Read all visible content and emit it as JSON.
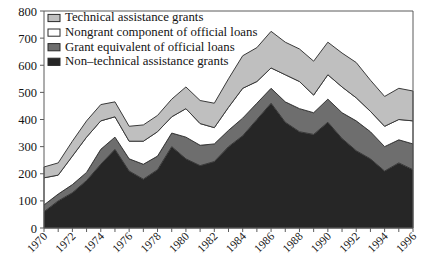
{
  "chart_data": {
    "type": "area",
    "stacked": true,
    "title": "",
    "subtitle": "",
    "xlabel": "",
    "ylabel": "",
    "xlim": [
      1970,
      1996
    ],
    "ylim": [
      0,
      800
    ],
    "yticks": [
      0,
      100,
      200,
      300,
      400,
      500,
      600,
      700,
      800
    ],
    "ytick_labels": [
      "0",
      "100",
      "200",
      "300",
      "400",
      "500",
      "600",
      "700",
      "800"
    ],
    "xticks": [
      1970,
      1971,
      1972,
      1973,
      1974,
      1975,
      1976,
      1977,
      1978,
      1979,
      1980,
      1981,
      1982,
      1983,
      1984,
      1985,
      1986,
      1987,
      1988,
      1989,
      1990,
      1991,
      1992,
      1993,
      1994,
      1995,
      1996
    ],
    "xtick_labels": [
      "1970",
      "",
      "1972",
      "",
      "1974",
      "",
      "1976",
      "",
      "1978",
      "",
      "1980",
      "",
      "1982",
      "",
      "1984",
      "",
      "1986",
      "",
      "1988",
      "",
      "1990",
      "",
      "1992",
      "",
      "1994",
      "",
      "1996"
    ],
    "grid": false,
    "legend_position": "top-left",
    "x": [
      1970,
      1971,
      1972,
      1973,
      1974,
      1975,
      1976,
      1977,
      1978,
      1979,
      1980,
      1981,
      1982,
      1983,
      1984,
      1985,
      1986,
      1987,
      1988,
      1989,
      1990,
      1991,
      1992,
      1993,
      1994,
      1995,
      1996
    ],
    "series": [
      {
        "name": "Non-technical assistance grants",
        "color": "#262626",
        "stack_order": 1,
        "values": [
          60,
          100,
          130,
          175,
          235,
          290,
          210,
          180,
          215,
          300,
          255,
          230,
          245,
          300,
          340,
          400,
          460,
          390,
          355,
          345,
          390,
          330,
          285,
          255,
          210,
          240,
          215
        ]
      },
      {
        "name": "Grant equivalent of official loans",
        "color": "#6e6e6e",
        "stack_order": 2,
        "values": [
          25,
          25,
          30,
          30,
          55,
          45,
          45,
          55,
          50,
          50,
          80,
          75,
          65,
          60,
          65,
          60,
          55,
          75,
          85,
          80,
          85,
          95,
          110,
          100,
          90,
          85,
          95
        ]
      },
      {
        "name": "Nongrant component of official loans",
        "color": "#ffffff",
        "stack_order": 3,
        "values": [
          100,
          70,
          105,
          130,
          105,
          75,
          65,
          85,
          90,
          60,
          105,
          80,
          60,
          85,
          110,
          80,
          75,
          100,
          100,
          65,
          90,
          95,
          85,
          75,
          75,
          75,
          85
        ]
      },
      {
        "name": "Technical assistance grants",
        "color": "#bfbfbf",
        "stack_order": 4,
        "values": [
          40,
          45,
          55,
          60,
          60,
          55,
          55,
          60,
          60,
          65,
          80,
          85,
          90,
          105,
          120,
          125,
          135,
          120,
          120,
          125,
          120,
          125,
          130,
          115,
          110,
          115,
          110
        ]
      }
    ],
    "legend": [
      {
        "label": "Technical assistance grants",
        "color": "#bfbfbf"
      },
      {
        "label": "Nongrant component of official loans",
        "color": "#ffffff"
      },
      {
        "label": "Grant equivalent of official loans",
        "color": "#6e6e6e"
      },
      {
        "label": "Non–technical assistance grants",
        "color": "#262626"
      }
    ]
  },
  "plot": {
    "left": 44,
    "right": 413,
    "top": 11,
    "bottom": 228
  }
}
